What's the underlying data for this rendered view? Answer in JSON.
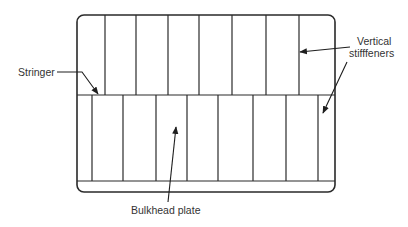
{
  "diagram": {
    "frame": {
      "x": 77,
      "y": 15,
      "width": 258,
      "height": 177,
      "corner_radius": 7
    },
    "stringer_y": 95,
    "bottom_flange_y": 181,
    "top_panel_stiffeners_x": [
      105,
      136,
      168,
      199,
      232,
      266,
      299
    ],
    "bottom_panel_stiffeners_x": [
      92,
      123,
      156,
      187,
      218,
      253,
      286,
      318
    ],
    "colors": {
      "line": "#2a2a2a",
      "text": "#333333",
      "background": "#ffffff"
    }
  },
  "labels": {
    "stringer": "Stringer",
    "vertical_stiffeners_line1": "Vertical",
    "vertical_stiffeners_line2": "stifffeners",
    "bulkhead_plate": "Bulkhead plate"
  },
  "arrows": {
    "stringer": {
      "points": [
        [
          57,
          72
        ],
        [
          82,
          72
        ],
        [
          98,
          94
        ]
      ]
    },
    "stiffener_top": {
      "from": [
        350,
        47
      ],
      "to": [
        300,
        52
      ]
    },
    "stiffener_bottom": {
      "from": [
        347,
        62
      ],
      "to": [
        323,
        113
      ]
    },
    "bulkhead_plate": {
      "from": [
        168,
        202
      ],
      "to": [
        176,
        127
      ]
    }
  }
}
